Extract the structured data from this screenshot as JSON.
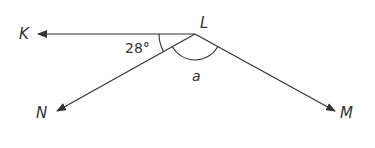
{
  "diagram": {
    "type": "angles",
    "vertex": "L",
    "rays": [
      "K",
      "N",
      "M"
    ],
    "labels": {
      "K": "K",
      "L": "L",
      "N": "N",
      "M": "M"
    },
    "angles": {
      "KLN": "28°",
      "NLM": "a"
    },
    "colors": {
      "line": "#333333",
      "background": "#ffffff"
    }
  }
}
